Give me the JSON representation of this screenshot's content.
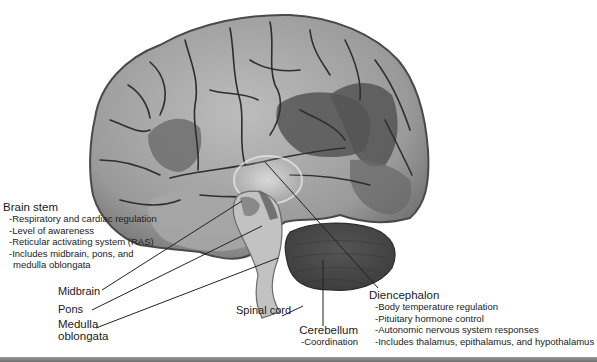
{
  "figure": {
    "labels": {
      "brain_stem": {
        "title": "Brain stem",
        "items": [
          "-Respiratory and cardiac regulation",
          "-Level of awareness",
          "-Reticular activating system (RAS)",
          "-Includes midbrain, pons, and",
          "medulla oblongata"
        ]
      },
      "midbrain": "Midbrain",
      "pons": "Pons",
      "medulla": [
        "Medulla",
        "oblongata"
      ],
      "spinal_cord": "Spinal cord",
      "cerebellum": {
        "title": "Cerebellum",
        "items": [
          "-Coordination"
        ]
      },
      "diencephalon": {
        "title": "Diencephalon",
        "items": [
          "-Body temperature regulation",
          "-Pituitary hormone control",
          "-Autonomic nervous system responses",
          "-Includes thalamus, epithalamus, and hypothalamus"
        ]
      }
    },
    "colors": {
      "cortex_light": "#b4b4b4",
      "cortex_mid": "#8c8c8c",
      "cortex_dark": "#5c5c5c",
      "sulci": "#2e2e2e",
      "cerebellum": "#4a4a4a",
      "brainstem": "#c4c4c4",
      "leader_line": "#222222"
    }
  }
}
